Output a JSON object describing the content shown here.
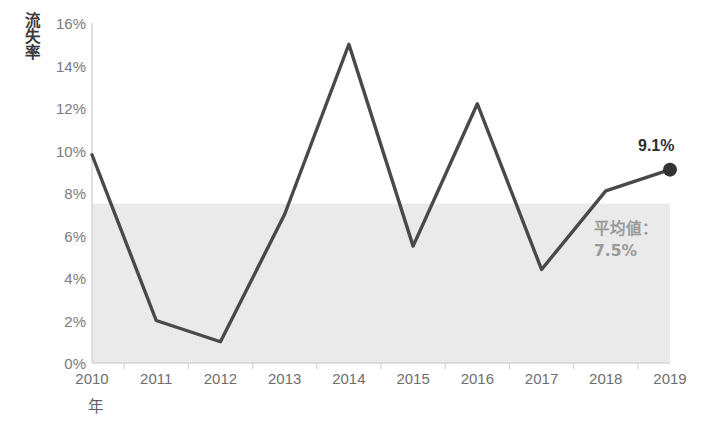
{
  "chart_data": {
    "type": "line",
    "title": "",
    "subtitle": "",
    "xlabel": "年",
    "ylabel": "流失率",
    "grid": false,
    "legend": "none",
    "xlim": [
      2010,
      2019
    ],
    "ylim": [
      0,
      16
    ],
    "y_tick_step": 2,
    "categories": [
      "2010",
      "2011",
      "2012",
      "2013",
      "2014",
      "2015",
      "2016",
      "2017",
      "2018",
      "2019"
    ],
    "x_tick_labels": [
      "2010",
      "2011",
      "2012",
      "2013",
      "2014",
      "2015",
      "2016",
      "2017",
      "2018",
      "2019"
    ],
    "y_tick_labels": [
      "0%",
      "2%",
      "4%",
      "6%",
      "8%",
      "10%",
      "12%",
      "14%",
      "16%"
    ],
    "y_tick_values": [
      0,
      2,
      4,
      6,
      8,
      10,
      12,
      14,
      16
    ],
    "series": [
      {
        "name": "流失率",
        "values": [
          9.8,
          2.0,
          1.0,
          7.0,
          15.0,
          5.5,
          12.2,
          4.4,
          8.1,
          9.1
        ],
        "color": "#494949",
        "line_width": 3.4,
        "marker_last": true,
        "marker_color": "#333333",
        "marker_radius": 7
      }
    ],
    "annotations": [
      {
        "name": "mean-band",
        "type": "shaded-band",
        "from": 0,
        "to": 7.5,
        "color": "#eaeaea",
        "label_line1": "平均値：",
        "label_line2": "7.5%",
        "label_color": "#9a9a9a"
      },
      {
        "name": "last-point-label",
        "type": "data-label",
        "category": "2019",
        "value": 9.1,
        "text": "9.1%",
        "color": "#2f2f2f"
      }
    ],
    "axis_color": "#d4d4d4",
    "background": "#ffffff"
  },
  "axes": {
    "y_title": "流失率",
    "x_title": "年"
  },
  "annotation_text": {
    "mean_label": "平均値：",
    "mean_value": "7.5%",
    "last_value": "9.1%"
  }
}
